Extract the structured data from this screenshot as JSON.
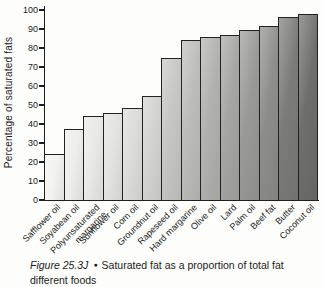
{
  "chart_data": {
    "type": "bar",
    "title": "",
    "xlabel": "",
    "ylabel": "Percentage of saturated fats",
    "ylim": [
      0,
      100
    ],
    "yticks": [
      0,
      10,
      20,
      30,
      40,
      50,
      60,
      70,
      80,
      90,
      100
    ],
    "grid": false,
    "legend": false,
    "categories": [
      "Safflower oil",
      "Soyabean oil",
      "Polyunsaturated\nmargarine",
      "Sunflower oil",
      "Corn oil",
      "Groundnut oil",
      "Rapeseed oil",
      "Hard margarine",
      "Olive oil",
      "Lard",
      "Palm oil",
      "Beef fat",
      "Butter",
      "Coconut oil"
    ],
    "values": [
      24,
      37.5,
      44,
      46,
      48.5,
      55,
      74.5,
      84,
      86,
      87,
      89.5,
      91.5,
      96.5,
      98
    ],
    "bar_colors": [
      "#f3f3f1",
      "#eeeeec",
      "#e9e9e7",
      "#e3e3e1",
      "#dcdcda",
      "#d3d3d1",
      "#c6c6c4",
      "#bcbcba",
      "#b1b1af",
      "#a5a5a3",
      "#999997",
      "#8d8d8b",
      "#7b7b79",
      "#6e6e6c"
    ],
    "bar_outline_color": "#222222"
  },
  "caption": {
    "figure_label": "Figure 25.3J",
    "bullet": "●",
    "text_line1": "Saturated fat as a proportion of total fat",
    "text_line2": "different foods"
  },
  "colors": {
    "background": "#fdfdfb",
    "text": "#1a1a1a",
    "axis": "#1f1f1f"
  }
}
